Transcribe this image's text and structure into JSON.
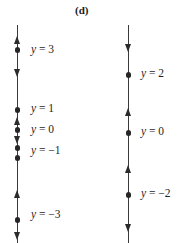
{
  "figure": {
    "panel_label": "(d)",
    "type": "phase-line-diagram",
    "background_color": "#ffffff",
    "line_color": "#3a3a3a",
    "dot_color": "#262626",
    "arrow_color": "#2b2b2b",
    "text_color": "#1f1f1f"
  },
  "phase_lines": [
    {
      "id": "left",
      "x": 17,
      "top": 25,
      "bottom": 243,
      "equilibria": [
        {
          "label": "y = 3",
          "y": 50,
          "label_x": 31,
          "label_y": 43
        },
        {
          "label": "y = 1",
          "y": 110,
          "label_x": 31,
          "label_y": 102
        },
        {
          "label": "y = 0",
          "y": 130,
          "label_x": 31,
          "label_y": 123
        },
        {
          "label": "y = −1",
          "y": 148,
          "label_x": 31,
          "label_y": 144
        },
        {
          "label": "",
          "y": 158,
          "label_x": 0,
          "label_y": 0
        },
        {
          "label": "y = −3",
          "y": 220,
          "label_x": 31,
          "label_y": 208
        }
      ],
      "arrows": [
        {
          "direction": "up",
          "y": 36
        },
        {
          "direction": "down",
          "y": 69
        },
        {
          "direction": "up",
          "y": 117
        },
        {
          "direction": "down",
          "y": 136
        },
        {
          "direction": "up",
          "y": 190
        },
        {
          "direction": "down",
          "y": 232
        }
      ]
    },
    {
      "id": "right",
      "x": 128,
      "top": 25,
      "bottom": 243,
      "equilibria": [
        {
          "label": "y = 2",
          "y": 75,
          "label_x": 141,
          "label_y": 67
        },
        {
          "label": "y = 0",
          "y": 133,
          "label_x": 141,
          "label_y": 125
        },
        {
          "label": "y = −2",
          "y": 195,
          "label_x": 141,
          "label_y": 187
        }
      ],
      "arrows": [
        {
          "direction": "down",
          "y": 44
        },
        {
          "direction": "up",
          "y": 108
        },
        {
          "direction": "up",
          "y": 165
        },
        {
          "direction": "down",
          "y": 224
        }
      ]
    }
  ]
}
